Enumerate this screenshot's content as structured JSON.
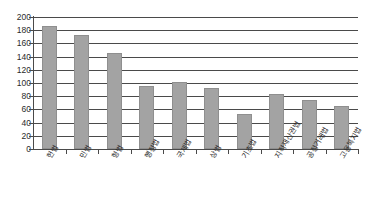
{
  "chart_data": {
    "type": "bar",
    "title": "",
    "subtitle": "",
    "xlabel": "",
    "ylabel": "",
    "categories": [
      "헌법",
      "민법",
      "형법",
      "행정법",
      "국제법",
      "상법",
      "기초법",
      "지적재산권법",
      "공정거래법",
      "고용복지법"
    ],
    "values": [
      186,
      172,
      146,
      95,
      101,
      93,
      53,
      83,
      75,
      65
    ],
    "ylim": [
      0,
      200
    ],
    "ytick_labels": [
      "200",
      "180",
      "160",
      "140",
      "120",
      "100",
      "80",
      "60",
      "40",
      "20",
      "0"
    ],
    "ytick_values": [
      200,
      180,
      160,
      140,
      120,
      100,
      80,
      60,
      40,
      20,
      0
    ],
    "ystep": 20,
    "grid": true,
    "legend": false,
    "legend_position": "none",
    "series": [
      {
        "name": "",
        "values": [
          186,
          172,
          146,
          95,
          101,
          93,
          53,
          83,
          75,
          65
        ],
        "color": "#a3a3a3"
      }
    ],
    "colors": {
      "bar_fill": "#a3a3a3",
      "bar_border": "#8f8f8f",
      "gridline": "#4a4a4a",
      "axis": "#4a4a4a",
      "text": "#2b2b2b",
      "background": "#ffffff"
    }
  }
}
